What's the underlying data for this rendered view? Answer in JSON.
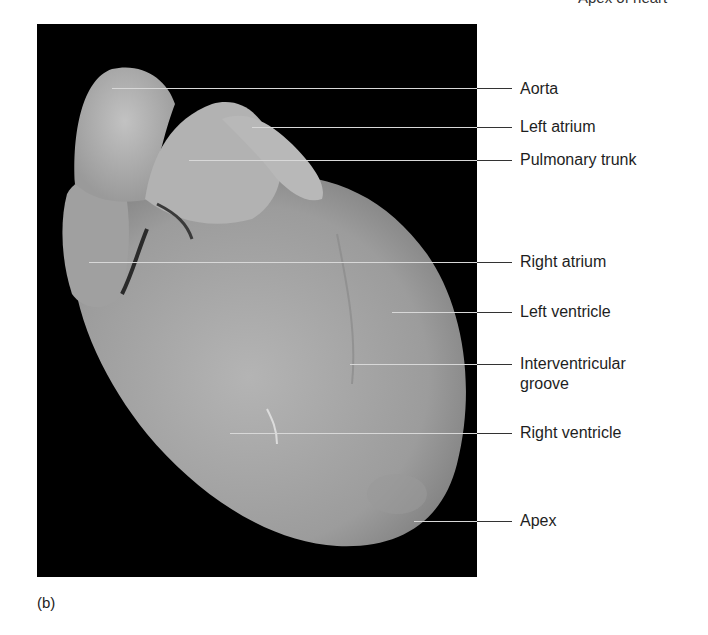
{
  "header_fragment": "Apex of heart",
  "figure": {
    "panel_label": "(b)",
    "labels": [
      {
        "text": "Aorta",
        "y": 89,
        "x_start": 112
      },
      {
        "text": "Left atrium",
        "y": 127,
        "x_start": 252
      },
      {
        "text": "Pulmonary trunk",
        "y": 160,
        "x_start": 189
      },
      {
        "text": "Right atrium",
        "y": 262,
        "x_start": 89
      },
      {
        "text": "Left ventricle",
        "y": 312,
        "x_start": 392
      },
      {
        "text": "Interventricular groove",
        "line1": "Interventricular",
        "line2": "groove",
        "y": 364,
        "x_start": 350
      },
      {
        "text": "Right ventricle",
        "y": 433,
        "x_start": 230
      },
      {
        "text": "Apex",
        "y": 521,
        "x_start": 414
      }
    ]
  },
  "colors": {
    "photo_background": "#000000",
    "tissue": "#a6a6a6",
    "leader_inside": "#d8d8d8",
    "leader_outside": "#333333"
  }
}
